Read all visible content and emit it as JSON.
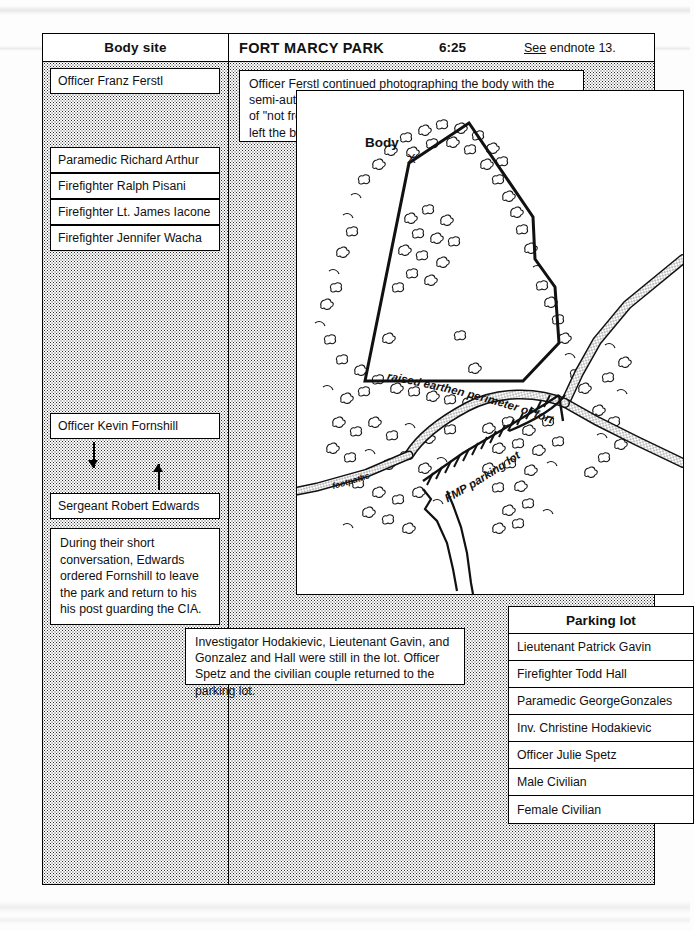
{
  "header": {
    "left_column_title": "Body site",
    "location_title": "FORT MARCY PARK",
    "time": "6:25",
    "endnote_prefix": "See",
    "endnote_text": " endnote 13."
  },
  "left_column": {
    "people_top": [
      "Officer Franz Ferstl"
    ],
    "people_group": [
      "Paramedic Richard Arthur",
      "Firefighter Ralph Pisani",
      "Firefighter Lt. James Iacone",
      "Firefighter Jennifer Wacha"
    ],
    "people_lower": [
      "Officer Kevin Fornshill",
      "Sergeant Robert Edwards"
    ],
    "note": "During their short conversation, Edwards ordered Fornshill to leave the park and return to his his post guarding the CIA.",
    "arrow_down": "arrow-down-icon",
    "arrow_up": "arrow-up-icon"
  },
  "body_site_note": "Officer Ferstl continued photographing the body with the semi-automatic pistol in the hand.  He saw a small amount of \"not  fresh\" blood around the mouth. Arthur and his group left the body, returning to the lot.",
  "parking_lot_note": "Investigator Hodakievic, Lieutenant Gavin, and Gonzalez and Hall were still in the lot.  Officer Spetz and the civilian couple returned to the parking lot.",
  "map": {
    "labels": {
      "body": "Body",
      "body_marker": "X",
      "perimeter": "raised earthen perimeter of fort",
      "parking_lot": "FMP parking lot",
      "footpaths": "footpaths"
    }
  },
  "parking_lot_table": {
    "title": "Parking lot",
    "rows": [
      "Lieutenant Patrick Gavin",
      "Firefighter Todd Hall",
      "Paramedic GeorgeGonzales",
      "Inv. Christine Hodakievic",
      "Officer Julie Spetz",
      "Male Civilian",
      "Female Civilian"
    ]
  },
  "colors": {
    "ink": "#000000",
    "paper": "#ffffff",
    "stipple": "#2b2b2b"
  }
}
